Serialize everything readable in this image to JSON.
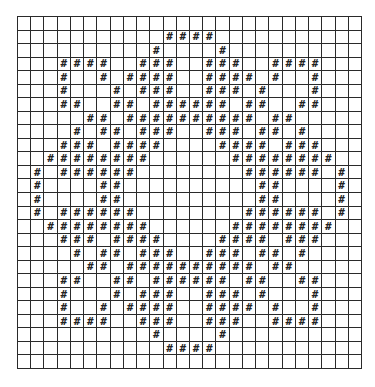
{
  "grid": {
    "rows": 26,
    "cols": 26,
    "mark_glyph": "#",
    "line_color": "#2a2a2a",
    "mark_color": "#222222",
    "background": "#ffffff",
    "marked": [
      [],
      [
        11,
        12,
        13,
        14
      ],
      [
        10,
        15
      ],
      [
        3,
        4,
        5,
        6,
        9,
        10,
        11,
        14,
        15,
        16,
        19,
        20,
        21,
        22
      ],
      [
        3,
        6,
        8,
        9,
        10,
        11,
        14,
        15,
        16,
        17,
        19,
        22
      ],
      [
        3,
        7,
        9,
        10,
        11,
        14,
        15,
        16,
        18,
        22
      ],
      [
        3,
        4,
        7,
        8,
        10,
        11,
        12,
        13,
        14,
        15,
        17,
        18,
        21,
        22
      ],
      [
        5,
        6,
        8,
        9,
        10,
        11,
        12,
        13,
        14,
        15,
        16,
        17,
        19,
        20
      ],
      [
        4,
        6,
        7,
        9,
        10,
        11,
        14,
        15,
        16,
        18,
        19,
        21
      ],
      [
        3,
        4,
        5,
        7,
        8,
        9,
        10,
        15,
        16,
        17,
        18,
        20,
        21,
        22
      ],
      [
        2,
        3,
        4,
        5,
        6,
        7,
        8,
        9,
        16,
        17,
        18,
        19,
        20,
        21,
        22,
        23
      ],
      [
        1,
        3,
        4,
        5,
        6,
        7,
        8,
        17,
        18,
        19,
        20,
        21,
        22,
        24
      ],
      [
        1,
        6,
        7,
        18,
        19,
        24
      ],
      [
        1,
        6,
        7,
        18,
        19,
        24
      ],
      [
        1,
        3,
        4,
        5,
        6,
        7,
        8,
        17,
        18,
        19,
        20,
        21,
        22,
        24
      ],
      [
        2,
        3,
        4,
        5,
        6,
        7,
        8,
        9,
        16,
        17,
        18,
        19,
        20,
        21,
        22,
        23
      ],
      [
        3,
        4,
        5,
        7,
        8,
        9,
        10,
        15,
        16,
        17,
        18,
        20,
        21,
        22
      ],
      [
        4,
        6,
        7,
        9,
        10,
        11,
        14,
        15,
        16,
        18,
        19,
        21
      ],
      [
        5,
        6,
        8,
        9,
        10,
        11,
        12,
        13,
        14,
        15,
        16,
        17,
        19,
        20
      ],
      [
        3,
        4,
        7,
        8,
        10,
        11,
        12,
        13,
        14,
        15,
        17,
        18,
        21,
        22
      ],
      [
        3,
        7,
        9,
        10,
        11,
        14,
        15,
        16,
        18,
        22
      ],
      [
        3,
        6,
        8,
        9,
        10,
        11,
        14,
        15,
        16,
        17,
        19,
        22
      ],
      [
        3,
        4,
        5,
        6,
        9,
        10,
        11,
        14,
        15,
        16,
        19,
        20,
        21,
        22
      ],
      [
        10,
        15
      ],
      [
        11,
        12,
        13,
        14
      ],
      []
    ]
  }
}
